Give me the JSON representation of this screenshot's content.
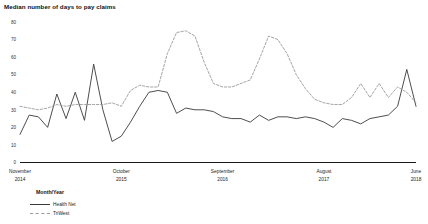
{
  "chart_data": {
    "type": "line",
    "title": "Median number of days to pay claims",
    "xlabel": "Month/Year",
    "ylabel": "",
    "ylim": [
      0,
      80
    ],
    "yticks": [
      0,
      10,
      20,
      30,
      40,
      50,
      60,
      70,
      80
    ],
    "grid": false,
    "legend_position": "bottom-left",
    "xtick_labels": [
      {
        "month": "November",
        "year": "2014",
        "index": 0
      },
      {
        "month": "October",
        "year": "2015",
        "index": 11
      },
      {
        "month": "September",
        "year": "2016",
        "index": 22
      },
      {
        "month": "August",
        "year": "2017",
        "index": 33
      },
      {
        "month": "June",
        "year": "2018",
        "index": 43
      }
    ],
    "x": [
      "November 2014",
      "December 2014",
      "January 2015",
      "February 2015",
      "March 2015",
      "April 2015",
      "May 2015",
      "June 2015",
      "July 2015",
      "August 2015",
      "September 2015",
      "October 2015",
      "November 2015",
      "December 2015",
      "January 2016",
      "February 2016",
      "March 2016",
      "April 2016",
      "May 2016",
      "June 2016",
      "July 2016",
      "August 2016",
      "September 2016",
      "October 2016",
      "November 2016",
      "December 2016",
      "January 2017",
      "February 2017",
      "March 2017",
      "April 2017",
      "May 2017",
      "June 2017",
      "July 2017",
      "August 2017",
      "September 2017",
      "October 2017",
      "November 2017",
      "December 2017",
      "January 2018",
      "February 2018",
      "March 2018",
      "April 2018",
      "May 2018",
      "June 2018"
    ],
    "series": [
      {
        "name": "Health Net",
        "style": "solid",
        "color": "#3a3a3a",
        "values": [
          16,
          27,
          26,
          20,
          39,
          25,
          40,
          24,
          56,
          30,
          12,
          15,
          23,
          32,
          40,
          41,
          40,
          28,
          31,
          30,
          30,
          29,
          26,
          25,
          25,
          23,
          27,
          24,
          26,
          26,
          25,
          26,
          25,
          23,
          20,
          25,
          24,
          22,
          25,
          26,
          27,
          32,
          53,
          32
        ]
      },
      {
        "name": "TriWest",
        "style": "dashed",
        "color": "#9a9a9a",
        "values": [
          32,
          31,
          30,
          31,
          33,
          32,
          33,
          33,
          33,
          33,
          34,
          32,
          41,
          44,
          43,
          43,
          62,
          74,
          75,
          72,
          57,
          45,
          43,
          43,
          45,
          47,
          59,
          72,
          70,
          62,
          50,
          42,
          36,
          34,
          33,
          33,
          37,
          45,
          37,
          45,
          37,
          43,
          40,
          34
        ]
      }
    ]
  },
  "legend": {
    "axis_title": "Month/Year"
  }
}
